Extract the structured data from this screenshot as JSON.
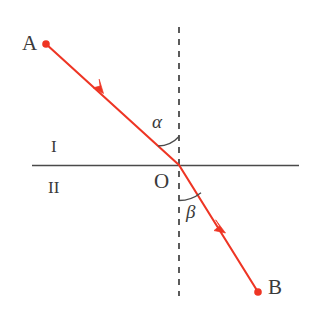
{
  "diagram": {
    "type": "optics-refraction-diagram",
    "colors": {
      "ray": "#ee3524",
      "line": "#4a4a4a",
      "label": "#3a3a3a",
      "background": "#ffffff"
    },
    "labels": {
      "point_a": "A",
      "point_b": "B",
      "point_o": "O",
      "medium_upper": "I",
      "medium_lower": "II",
      "angle_incidence": "α",
      "angle_refraction": "β"
    },
    "geometry": {
      "interface_y": 165,
      "interface_x_start": 32,
      "interface_x_end": 299,
      "normal_x": 179,
      "normal_y_start": 27,
      "normal_y_end": 296,
      "point_a": [
        46,
        44
      ],
      "point_o": [
        179,
        165
      ],
      "point_b": [
        258,
        292
      ],
      "arrow_incident": [
        103,
        92
      ],
      "arrow_refracted": [
        224,
        231
      ]
    },
    "label_positions": {
      "point_a": [
        22,
        33
      ],
      "point_b": [
        268,
        277
      ],
      "point_o": [
        154,
        171
      ],
      "medium_upper": [
        51,
        138
      ],
      "medium_lower": [
        48,
        179
      ],
      "angle_incidence": [
        152,
        112
      ],
      "angle_refraction": [
        186,
        202
      ]
    }
  }
}
